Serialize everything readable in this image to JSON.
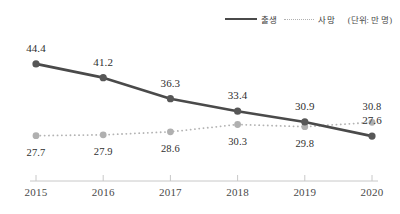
{
  "chart_data": {
    "type": "line",
    "title": "",
    "xlabel": "",
    "ylabel": "",
    "unit_note": "(단위: 만 명)",
    "categories": [
      "2015",
      "2016",
      "2017",
      "2018",
      "2019",
      "2020"
    ],
    "x": [
      2015,
      2016,
      2017,
      2018,
      2019,
      2020
    ],
    "xlim": [
      2015,
      2020
    ],
    "ylim": [
      26.0,
      46.0
    ],
    "grid": false,
    "legend_position": "top-right",
    "series": [
      {
        "name": "출생",
        "style": "solid",
        "color": "#4a4a4a",
        "marker": "circle",
        "label_position": "above",
        "values": [
          44.4,
          41.2,
          36.3,
          33.4,
          30.9,
          27.6
        ],
        "labels": [
          "44.4",
          "41.2",
          "36.3",
          "33.4",
          "30.9",
          "27.6"
        ]
      },
      {
        "name": "사망",
        "style": "dotted",
        "color": "#b3b3b3",
        "marker": "circle",
        "label_position": "below",
        "values": [
          27.7,
          27.9,
          28.6,
          30.3,
          29.8,
          30.8
        ],
        "labels": [
          "27.7",
          "27.9",
          "28.6",
          "30.3",
          "29.8",
          "30.8"
        ]
      }
    ],
    "annotations": []
  },
  "legend": {
    "births_label": "출생",
    "deaths_label": "사망",
    "unit_label": "(단위: 만 명)"
  },
  "axis": {
    "tick_labels": [
      "2015",
      "2016",
      "2017",
      "2018",
      "2019",
      "2020"
    ],
    "line_color": "#c8c8c8"
  },
  "colors": {
    "births_line": "#4a4a4a",
    "deaths_line": "#b3b3b3",
    "births_marker": "#575757",
    "deaths_marker": "#b0b0b0",
    "axis": "#c8c8c8",
    "text": "#2f2f2f",
    "background": "#ffffff"
  }
}
